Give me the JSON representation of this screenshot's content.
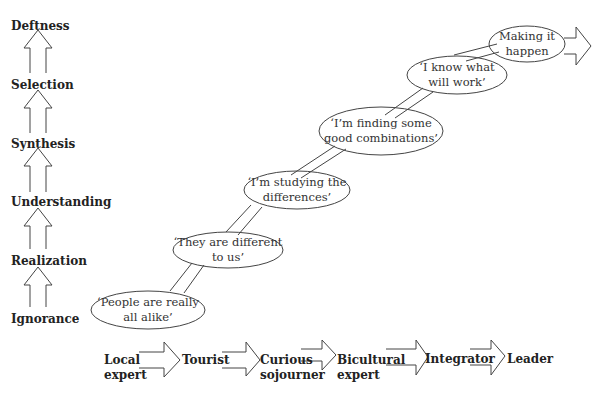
{
  "levels": [
    {
      "label": "Deftness"
    },
    {
      "label": "Selection"
    },
    {
      "label": "Synthesis"
    },
    {
      "label": "Understanding"
    },
    {
      "label": "Realization"
    },
    {
      "label": "Ignorance"
    }
  ],
  "ellipses": [
    {
      "line1": "‘People are really",
      "line2": "all alike’"
    },
    {
      "line1": "‘They are different",
      "line2": "to us’"
    },
    {
      "line1": "‘I’m studying the",
      "line2": "differences’"
    },
    {
      "line1": "‘I’m finding some",
      "line2": "good combinations’"
    },
    {
      "line1": "‘I know what",
      "line2": "will work’"
    },
    {
      "line1": "Making it",
      "line2": "happen"
    }
  ],
  "stages": [
    {
      "line1": "Local",
      "line2": "expert"
    },
    {
      "line1": "Tourist",
      "line2": ""
    },
    {
      "line1": "Curious",
      "line2": "sojourner"
    },
    {
      "line1": "Bicultural",
      "line2": "expert"
    },
    {
      "line1": "Integrator",
      "line2": ""
    },
    {
      "line1": "Leader",
      "line2": ""
    }
  ]
}
